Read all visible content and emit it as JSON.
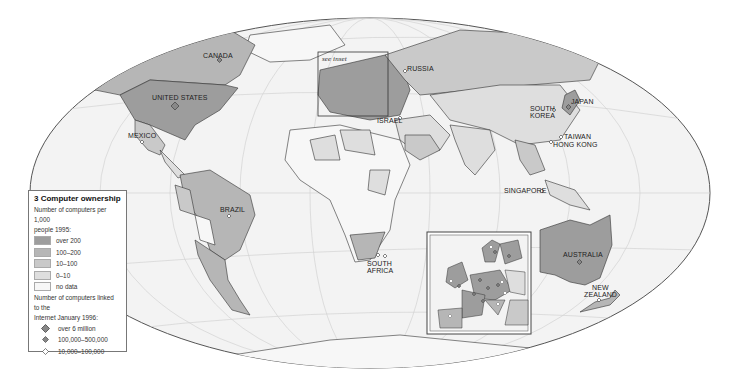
{
  "legend": {
    "title": "3 Computer ownership",
    "subtitle_line1": "Number of computers per 1,000",
    "subtitle_line2": "people 1995:",
    "classes": [
      {
        "label": "over 200",
        "color": "#9d9d9d"
      },
      {
        "label": "100–200",
        "color": "#b6b6b6"
      },
      {
        "label": "10–100",
        "color": "#c9c9c9"
      },
      {
        "label": "0–10",
        "color": "#dedede"
      },
      {
        "label": "no data",
        "color": "#f7f7f7"
      }
    ],
    "markers_title_line1": "Number of computers linked to the",
    "markers_title_line2": "Internet January 1996:",
    "markers": [
      {
        "label": "over 6 million",
        "symbol": "large-diamond"
      },
      {
        "label": "100,000–500,000",
        "symbol": "small-diamond"
      },
      {
        "label": "10,000–100,000",
        "symbol": "open-diamond"
      }
    ]
  },
  "map": {
    "inset_note": "see inset",
    "labels": {
      "canada": "CANADA",
      "united_states": "UNITED STATES",
      "mexico": "MEXICO",
      "brazil": "BRAZIL",
      "russia": "RUSSIA",
      "israel": "ISRAEL",
      "south_africa_1": "SOUTH",
      "south_africa_2": "AFRICA",
      "south_korea_1": "SOUTH",
      "south_korea_2": "KOREA",
      "japan": "JAPAN",
      "taiwan": "TAIWAN",
      "hong_kong": "HONG KONG",
      "singapore": "SINGAPORE",
      "australia": "AUSTRALIA",
      "new_zealand_1": "NEW",
      "new_zealand_2": "ZEALAND"
    }
  }
}
